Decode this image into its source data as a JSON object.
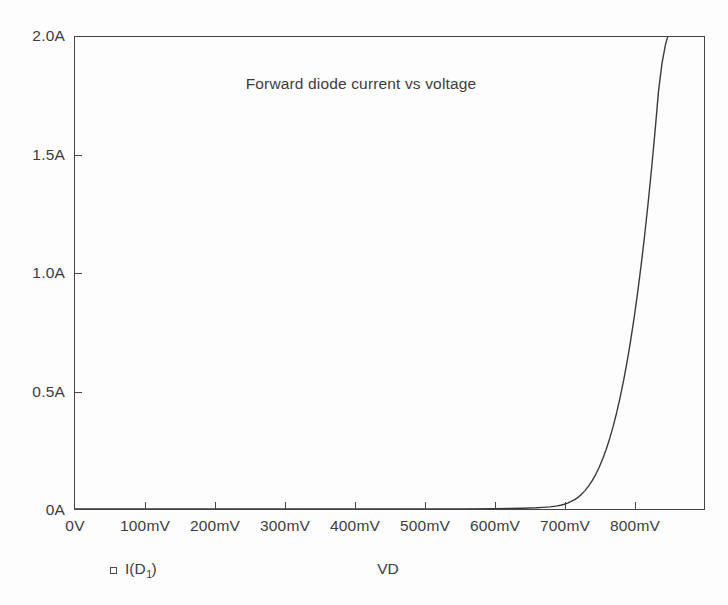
{
  "chart_data": {
    "type": "line",
    "title": "Forward diode current vs voltage",
    "xlabel": "VD",
    "ylabel": "",
    "grid": false,
    "legend_position": "bottom-left",
    "legend": [
      {
        "marker": "open-square",
        "label_prefix": "I(D",
        "label_sub": "1",
        "label_suffix": ")"
      }
    ],
    "xlim": [
      0,
      900
    ],
    "ylim": [
      0,
      2.0
    ],
    "x_unit": "mV",
    "y_unit": "A",
    "xticks": [
      0,
      100,
      200,
      300,
      400,
      500,
      600,
      700,
      800
    ],
    "xticklabels": [
      "0V",
      "100mV",
      "200mV",
      "300mV",
      "400mV",
      "500mV",
      "600mV",
      "700mV",
      "800mV"
    ],
    "yticks": [
      0,
      0.5,
      1.0,
      1.5,
      2.0
    ],
    "yticklabels": [
      "0A",
      "0.5A",
      "1.0A",
      "1.5A",
      "2.0A"
    ],
    "series": [
      {
        "name": "I(D1)",
        "color": "#3a3a3a",
        "x": [
          0,
          100,
          200,
          300,
          400,
          500,
          550,
          600,
          620,
          640,
          660,
          670,
          680,
          690,
          695,
          700,
          705,
          710,
          715,
          720,
          725,
          730,
          735,
          740,
          745,
          750,
          755,
          760,
          765,
          770,
          775,
          780,
          785,
          790,
          795,
          800,
          805,
          810,
          815,
          820,
          825,
          830,
          835,
          840,
          845,
          848
        ],
        "y": [
          0,
          0,
          0,
          0,
          0,
          0,
          0,
          0.001,
          0.002,
          0.003,
          0.005,
          0.007,
          0.009,
          0.013,
          0.016,
          0.02,
          0.025,
          0.032,
          0.04,
          0.05,
          0.063,
          0.079,
          0.098,
          0.12,
          0.146,
          0.177,
          0.212,
          0.252,
          0.298,
          0.35,
          0.408,
          0.473,
          0.545,
          0.625,
          0.713,
          0.81,
          0.916,
          1.032,
          1.158,
          1.295,
          1.443,
          1.602,
          1.773,
          1.89,
          1.97,
          2.0
        ]
      }
    ]
  },
  "colors": {
    "background": "#fdfdfd",
    "axis": "#474747",
    "text": "#3c3c3c",
    "curve": "#3a3a3a"
  }
}
